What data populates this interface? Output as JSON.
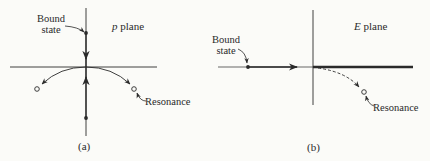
{
  "figure": {
    "panel_a": {
      "caption": "(a)",
      "plane_symbol": "p",
      "plane_word": "plane",
      "bound_state_line1": "Bound",
      "bound_state_line2": "state",
      "resonance_label": "Resonance",
      "elements": {
        "bound_state_point": "filled dot on positive imaginary axis",
        "virtual_state_point": "filled dot on negative imaginary axis",
        "resonance_points": "open circles in lower half-plane, symmetric about imaginary axis",
        "trajectories": "arrows along imaginary axis toward origin, then arcs into lower half-plane"
      }
    },
    "panel_b": {
      "caption": "(b)",
      "plane_symbol": "E",
      "plane_word": "plane",
      "bound_state_line1": "Bound",
      "bound_state_line2": "state",
      "resonance_label": "Resonance",
      "elements": {
        "bound_state_point": "filled dot on negative real axis",
        "branch_cut": "thick line along positive real axis",
        "resonance_point": "open circle below positive real axis",
        "trajectory": "arrow along negative real axis toward origin, dashed curve to resonance"
      }
    },
    "colors": {
      "ink": "#2a2a2a",
      "background": "#fbfbf8"
    }
  }
}
